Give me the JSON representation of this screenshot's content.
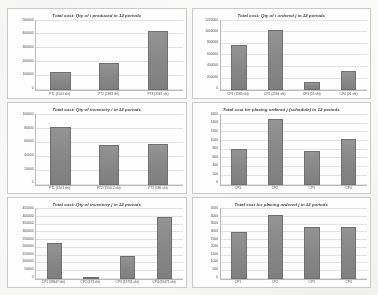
{
  "page": {
    "background_color": "#fcfcfb",
    "card_border_color": "#c9c9c9",
    "bar_color": "#8c8c8c",
    "gridline_color": "#e2e2e2",
    "axis_color": "#b9b9b9"
  },
  "chart_data": [
    {
      "id": "chart-qty-produced-i",
      "type": "bar",
      "title": "Total cost: Qty of i produced in 12 periods",
      "xlabel": "",
      "ylabel": "",
      "grid": true,
      "legend": "none",
      "ylim": [
        0,
        500000
      ],
      "yticks": [
        "500000",
        "400000",
        "300000",
        "200000",
        "100000",
        "0"
      ],
      "categories": [
        "PT1 (1505 sht)",
        "PT2 (1983 sht)",
        "PT3 (2567 sht)"
      ],
      "values": [
        130000,
        190000,
        420000
      ]
    },
    {
      "id": "chart-qty-ordered-i",
      "type": "bar",
      "title": "Total cost: Qty of i ordered j in 12 periods",
      "xlabel": "",
      "ylabel": "",
      "grid": true,
      "legend": "none",
      "ylim": [
        0,
        1200000
      ],
      "yticks": [
        "1200000",
        "1000000",
        "800000",
        "600000",
        "400000",
        "200000",
        "0"
      ],
      "categories": [
        "CP1 (1589 sht)",
        "CP2 (2594 sht)",
        "CP3 (55 sht)",
        "CP4 (26 sht)"
      ],
      "values": [
        760000,
        1030000,
        140000,
        330000
      ]
    },
    {
      "id": "chart-qty-inventory-i",
      "type": "bar",
      "title": "Total cost: Qty of inventory i in 12 periods",
      "xlabel": "",
      "ylabel": "",
      "grid": true,
      "legend": "none",
      "ylim": [
        0,
        100000
      ],
      "yticks": [
        "100000",
        "80000",
        "60000",
        "40000",
        "20000",
        "0"
      ],
      "categories": [
        "PT1 (1203 sht)",
        "PT2 (1550.2 sht)",
        "PT3 (586 sht)"
      ],
      "values": [
        82000,
        56000,
        58000
      ]
    },
    {
      "id": "chart-placing-ordered-schedule",
      "type": "bar",
      "title": "Total cost for placing ordered j (schedule) in 12 periods",
      "xlabel": "",
      "ylabel": "",
      "grid": true,
      "legend": "none",
      "ylim": [
        0,
        1600
      ],
      "yticks": [
        "1600",
        "1400",
        "1200",
        "1000",
        "800",
        "600",
        "400",
        "200",
        "0"
      ],
      "categories": [
        "CP1",
        "CP2",
        "CP3",
        "CP4"
      ],
      "values": [
        800,
        1480,
        760,
        1030
      ]
    },
    {
      "id": "chart-qty-inventory-j",
      "type": "bar",
      "title": "Total cost: Qty of inventory j in 12 periods",
      "xlabel": "",
      "ylabel": "",
      "grid": true,
      "legend": "none",
      "ylim": [
        0,
        450000
      ],
      "yticks": [
        "450000",
        "400000",
        "350000",
        "300000",
        "250000",
        "200000",
        "150000",
        "100000",
        "50000",
        "0"
      ],
      "categories": [
        "CP1 (39647 sht)",
        "CP2 (473 sht)",
        "CP3 (19731 sht)",
        "CP4 (93471 sht)"
      ],
      "values": [
        230000,
        0,
        145000,
        395000
      ]
    },
    {
      "id": "chart-placing-ordered-j",
      "type": "bar",
      "title": "Total cost for placing ordered j in 12 periods",
      "xlabel": "",
      "ylabel": "",
      "grid": true,
      "legend": "none",
      "ylim": [
        0,
        4500
      ],
      "yticks": [
        "4500",
        "4000",
        "3500",
        "3000",
        "2500",
        "2000",
        "1500",
        "1000",
        "500",
        "0"
      ],
      "categories": [
        "CP1",
        "CP2",
        "CP3",
        "CP4"
      ],
      "values": [
        3000,
        4050,
        3300,
        3300
      ]
    }
  ]
}
